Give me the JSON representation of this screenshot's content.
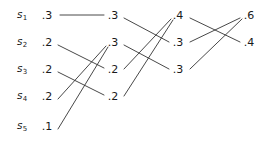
{
  "figure": {
    "type": "huffman-merge-diagram",
    "stroke_color": "#333333",
    "text_color": "#1a1a1a"
  },
  "sources": [
    {
      "name": "s",
      "index": "1",
      "probability": ".3",
      "x": 22,
      "y": 15
    },
    {
      "name": "s",
      "index": "2",
      "probability": ".2",
      "x": 22,
      "y": 42
    },
    {
      "name": "s",
      "index": "3",
      "probability": ".2",
      "x": 22,
      "y": 69
    },
    {
      "name": "s",
      "index": "4",
      "probability": ".2",
      "x": 22,
      "y": 96
    },
    {
      "name": "s",
      "index": "5",
      "probability": ".1",
      "x": 22,
      "y": 126
    }
  ],
  "columns": [
    {
      "id": "col1",
      "label": "source probabilities",
      "nodes": [
        {
          "id": "c1n1",
          "value": ".3",
          "x": 47,
          "y": 15
        },
        {
          "id": "c1n2",
          "value": ".2",
          "x": 47,
          "y": 42
        },
        {
          "id": "c1n3",
          "value": ".2",
          "x": 47,
          "y": 69
        },
        {
          "id": "c1n4",
          "value": ".2",
          "x": 47,
          "y": 96
        },
        {
          "id": "c1n5",
          "value": ".1",
          "x": 47,
          "y": 126
        }
      ]
    },
    {
      "id": "col2",
      "label": "first reduction",
      "nodes": [
        {
          "id": "c2n1",
          "value": ".3",
          "x": 113,
          "y": 15
        },
        {
          "id": "c2n2",
          "value": ".3",
          "x": 113,
          "y": 42
        },
        {
          "id": "c2n3",
          "value": ".2",
          "x": 113,
          "y": 69
        },
        {
          "id": "c2n4",
          "value": ".2",
          "x": 113,
          "y": 96
        }
      ]
    },
    {
      "id": "col3",
      "label": "second reduction",
      "nodes": [
        {
          "id": "c3n1",
          "value": ".4",
          "x": 178,
          "y": 15
        },
        {
          "id": "c3n2",
          "value": ".3",
          "x": 178,
          "y": 42
        },
        {
          "id": "c3n3",
          "value": ".3",
          "x": 178,
          "y": 69
        }
      ]
    },
    {
      "id": "col4",
      "label": "third reduction",
      "nodes": [
        {
          "id": "c4n1",
          "value": ".6",
          "x": 249,
          "y": 15
        },
        {
          "id": "c4n2",
          "value": ".4",
          "x": 249,
          "y": 42
        }
      ]
    }
  ],
  "edges": [
    {
      "id": "e1",
      "from": "c1n1",
      "to": "c2n1",
      "x1": 60,
      "y1": 15,
      "x2": 104,
      "y2": 15
    },
    {
      "id": "e2",
      "from": "c1n2",
      "to": "c2n3",
      "x1": 58,
      "y1": 45,
      "x2": 104,
      "y2": 68
    },
    {
      "id": "e3",
      "from": "c1n3",
      "to": "c2n4",
      "x1": 58,
      "y1": 72,
      "x2": 104,
      "y2": 95
    },
    {
      "id": "e4",
      "from": "c1n4",
      "to": "c2n2",
      "x1": 58,
      "y1": 99,
      "x2": 106,
      "y2": 46
    },
    {
      "id": "e5",
      "from": "c1n5",
      "to": "c2n2",
      "x1": 58,
      "y1": 129,
      "x2": 108,
      "y2": 47
    },
    {
      "id": "e6",
      "from": "c2n1",
      "to": "c3n2",
      "x1": 124,
      "y1": 18,
      "x2": 169,
      "y2": 42
    },
    {
      "id": "e7",
      "from": "c2n2",
      "to": "c3n3",
      "x1": 124,
      "y1": 45,
      "x2": 169,
      "y2": 69
    },
    {
      "id": "e8",
      "from": "c2n3",
      "to": "c3n1",
      "x1": 124,
      "y1": 69,
      "x2": 171,
      "y2": 19
    },
    {
      "id": "e9",
      "from": "c2n4",
      "to": "c3n1",
      "x1": 124,
      "y1": 96,
      "x2": 173,
      "y2": 20
    },
    {
      "id": "e10",
      "from": "c3n1",
      "to": "c4n2",
      "x1": 190,
      "y1": 18,
      "x2": 240,
      "y2": 42
    },
    {
      "id": "e11",
      "from": "c3n2",
      "to": "c4n1",
      "x1": 190,
      "y1": 42,
      "x2": 240,
      "y2": 18
    },
    {
      "id": "e12",
      "from": "c3n3",
      "to": "c4n1",
      "x1": 190,
      "y1": 69,
      "x2": 242,
      "y2": 19
    }
  ]
}
